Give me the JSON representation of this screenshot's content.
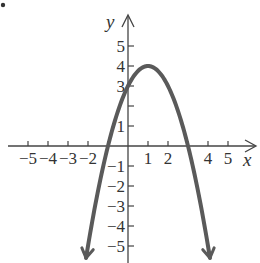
{
  "chart_data": {
    "type": "line",
    "title": "",
    "xlabel": "x",
    "ylabel": "y",
    "function": "y = -x^2 + 2x + 3",
    "xlim": [
      -6,
      6.4
    ],
    "ylim": [
      -5.8,
      6.5
    ],
    "grid": false,
    "x_ticks": [
      -5,
      -4,
      -3,
      -2,
      -1,
      1,
      2,
      3,
      4,
      5
    ],
    "x_tick_labels": [
      "-5",
      "-4",
      "-3",
      "-2",
      "",
      "1",
      "2",
      "",
      "4",
      "5"
    ],
    "y_ticks": [
      -5,
      -4,
      -3,
      -2,
      -1,
      1,
      2,
      3,
      4,
      5
    ],
    "y_tick_labels": [
      "-5",
      "-4",
      "-3",
      "-2",
      "-1",
      "1",
      "",
      "3",
      "4",
      "5"
    ],
    "vertex": [
      1,
      4
    ],
    "x_intercepts": [
      -1,
      3
    ],
    "y_intercept": 3,
    "series": [
      {
        "name": "parabola",
        "x": [
          -2.1,
          -1.5,
          -1,
          -0.5,
          0,
          0.5,
          1,
          1.5,
          2,
          2.5,
          3,
          3.5,
          4.1
        ],
        "y": [
          -6.61,
          -3.25,
          0,
          1.75,
          3,
          3.75,
          4,
          3.75,
          3,
          1.75,
          0,
          -3.25,
          -6.61
        ],
        "color": "#5a5a5a",
        "arrows_at_ends": true
      }
    ]
  },
  "labels": {
    "x_axis": "x",
    "y_axis": "y",
    "bullet": "•"
  },
  "x_tick_text": [
    {
      "v": -5,
      "t": "−5"
    },
    {
      "v": -4,
      "t": "−4"
    },
    {
      "v": -3,
      "t": "−3"
    },
    {
      "v": -2,
      "t": "−2"
    },
    {
      "v": 1,
      "t": "1"
    },
    {
      "v": 2,
      "t": "2"
    },
    {
      "v": 4,
      "t": "4"
    },
    {
      "v": 5,
      "t": "5"
    }
  ],
  "y_tick_text": [
    {
      "v": 5,
      "t": "5"
    },
    {
      "v": 4,
      "t": "4"
    },
    {
      "v": 3,
      "t": "3"
    },
    {
      "v": 1,
      "t": "1"
    },
    {
      "v": -1,
      "t": "−1"
    },
    {
      "v": -2,
      "t": "−2"
    },
    {
      "v": -3,
      "t": "−3"
    },
    {
      "v": -4,
      "t": "−4"
    },
    {
      "v": -5,
      "t": "−5"
    }
  ]
}
